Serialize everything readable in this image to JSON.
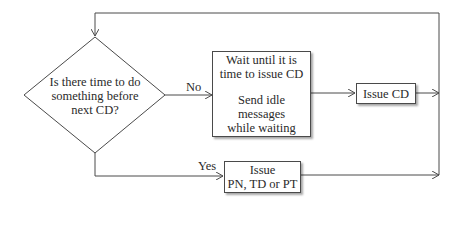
{
  "decision": {
    "lines": [
      "Is there time to do",
      "something before",
      "next CD?"
    ]
  },
  "edges": {
    "no_label": "No",
    "yes_label": "Yes"
  },
  "wait_box": {
    "line1": "Wait until it is",
    "line2": "time to issue CD",
    "line3": "Send idle messages",
    "line4": "while waiting"
  },
  "issue_cd_box": {
    "label": "Issue CD"
  },
  "issue_pn_box": {
    "line1": "Issue",
    "line2": "PN, TD or PT"
  },
  "colors": {
    "stroke": "#4a4a4a",
    "text": "#2a2a2a",
    "background": "#ffffff"
  }
}
